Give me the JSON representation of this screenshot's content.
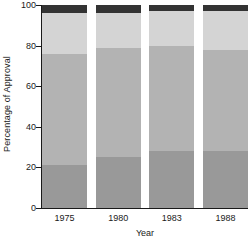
{
  "chart_data": {
    "type": "bar",
    "title": "",
    "subtitle": "",
    "xlabel": "Year",
    "ylabel": "Percentage of Approval",
    "categories": [
      "1975",
      "1980",
      "1983",
      "1988"
    ],
    "ylim": [
      0,
      100
    ],
    "ytick_labels": [
      "0",
      "20",
      "40",
      "60",
      "80",
      "100"
    ],
    "ytick_values": [
      0,
      20,
      40,
      60,
      80,
      100
    ],
    "grid": false,
    "legend": "none",
    "stacked": true,
    "series": [
      {
        "name": "segment-bottom",
        "color": "#999999",
        "values": [
          21,
          25,
          28,
          28
        ]
      },
      {
        "name": "segment-lower-middle",
        "color": "#b3b3b3",
        "values": [
          55,
          54,
          52,
          50
        ]
      },
      {
        "name": "segment-upper-middle",
        "color": "#d4d4d4",
        "values": [
          20,
          17,
          17,
          19
        ]
      },
      {
        "name": "segment-top",
        "color": "#333333",
        "values": [
          4,
          4,
          3,
          3
        ]
      }
    ],
    "cumulative_tops": [
      [
        21,
        76,
        96,
        100
      ],
      [
        25,
        79,
        96,
        100
      ],
      [
        28,
        80,
        97,
        100
      ],
      [
        28,
        78,
        97,
        100
      ]
    ]
  },
  "axis": {
    "line_color": "#1a1a1a"
  }
}
